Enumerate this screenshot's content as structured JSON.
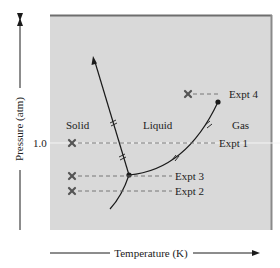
{
  "diagram": {
    "type": "phase-diagram",
    "colors": {
      "plot_background": "#d9d9d9",
      "plot_border": "#7a7a7a",
      "line": "#1a1a1a",
      "dashed": "#6b6b6b",
      "marker": "#555555",
      "reference_line": "#f4f4f4"
    },
    "axes": {
      "y_label": "Pressure (atm)",
      "x_label": "Temperature (K)",
      "y_tick": "1.0"
    },
    "regions": {
      "solid": "Solid",
      "liquid": "Liquid",
      "gas": "Gas"
    },
    "experiments": [
      {
        "label": "Expt 1"
      },
      {
        "label": "Expt 2"
      },
      {
        "label": "Expt 3"
      },
      {
        "label": "Expt 4"
      }
    ],
    "points": {
      "triple_point": "triple-point",
      "critical_point": "critical-point"
    }
  }
}
